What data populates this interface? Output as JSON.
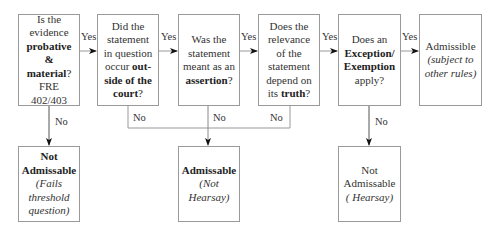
{
  "diagram": {
    "title": "",
    "questions": [
      {
        "id": "q1",
        "lines": [
          {
            "t": "Is the"
          },
          {
            "t": "evidence"
          },
          {
            "t": "probative",
            "s": "b"
          },
          {
            "t": "& material",
            "s": "b",
            "suffix": "?"
          },
          {
            "t": "FRE"
          },
          {
            "t": "402/403"
          }
        ]
      },
      {
        "id": "q2",
        "lines": [
          {
            "t": "Did the"
          },
          {
            "t": "statement"
          },
          {
            "t": "in question"
          },
          {
            "t": "occur ",
            "bold_tail": "out-"
          },
          {
            "t": "side of the",
            "s": "b"
          },
          {
            "t": "court",
            "s": "b",
            "suffix": "?"
          }
        ]
      },
      {
        "id": "q3",
        "lines": [
          {
            "t": "Was the"
          },
          {
            "t": "statement"
          },
          {
            "t": "meant as an"
          },
          {
            "t": "assertion",
            "s": "b",
            "suffix": "?"
          }
        ]
      },
      {
        "id": "q4",
        "lines": [
          {
            "t": "Does the"
          },
          {
            "t": "relevance"
          },
          {
            "t": "of the"
          },
          {
            "t": "statement"
          },
          {
            "t": "depend on"
          },
          {
            "t": "its ",
            "bold_tail": "truth",
            "suffix": "?"
          }
        ]
      },
      {
        "id": "q5",
        "lines": [
          {
            "t": "Does an"
          },
          {
            "t": "Exception/",
            "s": "b"
          },
          {
            "t": "Exemption",
            "s": "b"
          },
          {
            "t": "apply?"
          }
        ]
      },
      {
        "id": "r_admissible",
        "lines": [
          {
            "t": "Admissible"
          },
          {
            "t": "(subject to",
            "s": "i"
          },
          {
            "t": "other rules)",
            "s": "i"
          }
        ]
      }
    ],
    "outcomes": [
      {
        "id": "r_threshold",
        "lines": [
          {
            "t": "Not",
            "s": "b"
          },
          {
            "t": "Admissable",
            "s": "b"
          },
          {
            "t": "(Fails",
            "s": "i"
          },
          {
            "t": "threshold",
            "s": "i"
          },
          {
            "t": "question)",
            "s": "i"
          }
        ]
      },
      {
        "id": "r_not_hearsay",
        "lines": [
          {
            "t": "Admissable",
            "s": "b"
          },
          {
            "t": "(Not",
            "s": "i"
          },
          {
            "t": "Hearsay)",
            "s": "i"
          }
        ]
      },
      {
        "id": "r_hearsay",
        "lines": [
          {
            "t": "Not"
          },
          {
            "t": "Admissable"
          },
          {
            "t": "( Hearsay)",
            "s": "i"
          }
        ]
      }
    ],
    "edge_labels": {
      "yes": "Yes",
      "no": "No"
    },
    "colors": {
      "border": "#9a9a9a",
      "line": "#999999",
      "arrow": "#111111",
      "text": "#333333"
    }
  }
}
